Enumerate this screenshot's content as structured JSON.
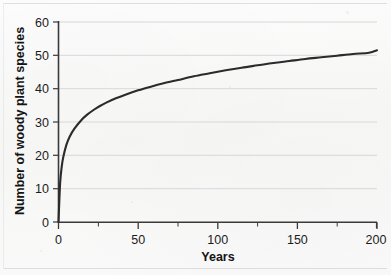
{
  "figure": {
    "name": "species-accumulation-curve",
    "background_color": "#fbfbfb",
    "curve_color": "#2b2b2b",
    "axis_color": "#3a3a3a",
    "gridline_color": "#d8d8dc"
  },
  "chart_data": {
    "type": "line",
    "title": "",
    "subtitle": "",
    "xlabel": "Years",
    "ylabel": "Number of woody plant species",
    "xlim": [
      0,
      200
    ],
    "ylim": [
      0,
      60
    ],
    "x_ticks": [
      0,
      50,
      100,
      150,
      200
    ],
    "x_tick_labels": [
      "0",
      "50",
      "100",
      "150",
      "200"
    ],
    "x_minor_ticks": [
      25,
      75,
      125,
      175
    ],
    "y_ticks": [
      0,
      10,
      20,
      30,
      40,
      50,
      60
    ],
    "y_tick_labels": [
      "0",
      "10",
      "20",
      "30",
      "40",
      "50",
      "60"
    ],
    "grid": "horizontal",
    "legend": "none",
    "annotations": [],
    "series": [
      {
        "name": "Number of woody plant species",
        "x": [
          0,
          1,
          2,
          3,
          5,
          7,
          10,
          14,
          18,
          22,
          26,
          30,
          36,
          42,
          50,
          58,
          66,
          75,
          85,
          95,
          105,
          115,
          125,
          135,
          145,
          155,
          165,
          175,
          185,
          195,
          200
        ],
        "values": [
          0,
          11.5,
          16.5,
          19.5,
          23.2,
          25.6,
          28.0,
          30.4,
          32.2,
          33.6,
          34.8,
          35.8,
          37.1,
          38.2,
          39.5,
          40.6,
          41.6,
          42.6,
          43.7,
          44.6,
          45.5,
          46.3,
          47.0,
          47.7,
          48.3,
          48.9,
          49.4,
          49.9,
          50.4,
          50.8,
          51.5
        ]
      }
    ]
  },
  "axis_labels": {
    "x_title": "Years",
    "y_title": "Number of woody plant species"
  }
}
